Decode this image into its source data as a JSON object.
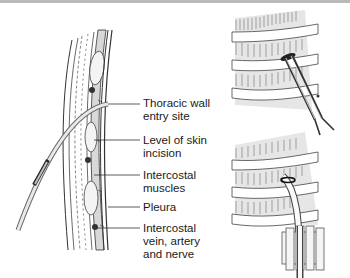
{
  "figure": {
    "labels": [
      {
        "id": "thoracic-wall-entry-site",
        "text": "Thoracic wall\nentry site"
      },
      {
        "id": "level-of-skin-incision",
        "text": "Level of skin\nincision"
      },
      {
        "id": "intercostal-muscles",
        "text": "Intercostal\nmuscles"
      },
      {
        "id": "pleura",
        "text": "Pleura"
      },
      {
        "id": "intercostal-vein-artery-nerve",
        "text": "Intercostal\nvein, artery\nand nerve"
      }
    ],
    "panels": [
      {
        "id": "cross-section",
        "description": "chest wall cross-section with needle entering"
      },
      {
        "id": "forceps-dissection",
        "description": "blunt dissection over rib with forceps"
      },
      {
        "id": "tube-insertion",
        "description": "chest tube inserted and secured"
      }
    ]
  }
}
